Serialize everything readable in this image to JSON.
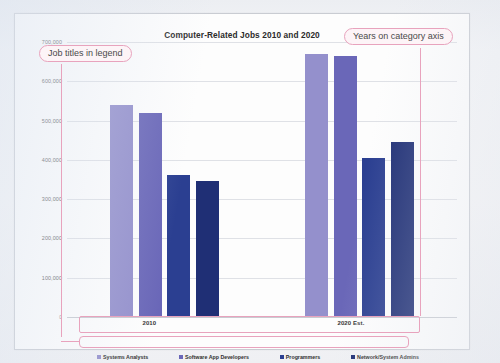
{
  "source_credit": "Excel 2016, Windows 10, Microsoft Corporation",
  "annotations": [
    {
      "id": "legend-callout",
      "text": "Job titles in legend"
    },
    {
      "id": "category-callout",
      "text": "Years on category axis"
    }
  ],
  "chart_data": {
    "type": "bar",
    "title": "Computer-Related Jobs 2010 and 2020",
    "xlabel": "",
    "ylabel": "",
    "categories": [
      "2010",
      "2020 Est."
    ],
    "series": [
      {
        "name": "Systems Analysts",
        "color": "#9490cc",
        "values": [
          540000,
          670000
        ]
      },
      {
        "name": "Software App Developers",
        "color": "#6a67b8",
        "values": [
          520000,
          665000
        ]
      },
      {
        "name": "Programmers",
        "color": "#2b3f91",
        "values": [
          362000,
          405000
        ]
      },
      {
        "name": "Network/System Admins",
        "color": "#1f2f75",
        "values": [
          345000,
          445000
        ]
      }
    ],
    "ylim": [
      0,
      700000
    ],
    "yticks": [
      0,
      100000,
      200000,
      300000,
      400000,
      500000,
      600000,
      700000
    ],
    "ytick_labels": [
      "0",
      "100,000",
      "200,000",
      "300,000",
      "400,000",
      "500,000",
      "600,000",
      "700,000"
    ],
    "grid": true,
    "legend_position": "bottom"
  }
}
